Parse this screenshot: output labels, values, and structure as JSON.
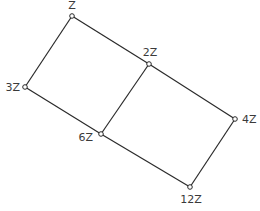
{
  "diagram": {
    "type": "lattice",
    "nodes": [
      {
        "id": "Z",
        "label": "Z",
        "x": 72,
        "y": 16,
        "lx": 72,
        "ly": 9,
        "anchor": "middle"
      },
      {
        "id": "2Z",
        "label": "2Z",
        "x": 149,
        "y": 64,
        "lx": 150,
        "ly": 56,
        "anchor": "middle"
      },
      {
        "id": "3Z",
        "label": "3Z",
        "x": 25,
        "y": 87,
        "lx": 20,
        "ly": 91,
        "anchor": "end"
      },
      {
        "id": "4Z",
        "label": "4Z",
        "x": 235,
        "y": 119,
        "lx": 242,
        "ly": 123,
        "anchor": "start"
      },
      {
        "id": "6Z",
        "label": "6Z",
        "x": 101,
        "y": 134,
        "lx": 93,
        "ly": 141,
        "anchor": "end"
      },
      {
        "id": "12Z",
        "label": "12Z",
        "x": 190,
        "y": 187,
        "lx": 191,
        "ly": 203,
        "anchor": "middle"
      }
    ],
    "edges": [
      [
        "Z",
        "2Z"
      ],
      [
        "Z",
        "3Z"
      ],
      [
        "3Z",
        "6Z"
      ],
      [
        "2Z",
        "6Z"
      ],
      [
        "2Z",
        "4Z"
      ],
      [
        "6Z",
        "12Z"
      ],
      [
        "4Z",
        "12Z"
      ]
    ]
  }
}
